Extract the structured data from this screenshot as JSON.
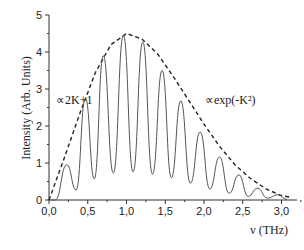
{
  "chart_data": {
    "type": "line",
    "title": "",
    "xlabel": "ν (THz)",
    "ylabel": "Intensity (Arb. Units)",
    "xlim": [
      0,
      3.2
    ],
    "ylim": [
      0,
      5
    ],
    "xticks": [
      "0,0",
      "0,5",
      "1,0",
      "1,5",
      "2,0",
      "2,5",
      "3,0"
    ],
    "xtick_values": [
      0,
      0.5,
      1.0,
      1.5,
      2.0,
      2.5,
      3.0
    ],
    "yticks": [
      "0",
      "1",
      "2",
      "3",
      "4",
      "5"
    ],
    "ytick_values": [
      0,
      1,
      2,
      3,
      4,
      5
    ],
    "grid": false,
    "legend": null,
    "series": [
      {
        "name": "Intensity spectrum",
        "style": "solid",
        "peaks_x": [
          0.23,
          0.47,
          0.7,
          0.96,
          1.21,
          1.46,
          1.7,
          1.95,
          2.2,
          2.45,
          2.69,
          2.95
        ],
        "peaks_y": [
          0.95,
          2.75,
          3.9,
          4.45,
          4.27,
          3.5,
          2.68,
          1.84,
          1.16,
          0.68,
          0.32,
          0.14
        ],
        "minima_y": [
          0.27,
          0.57,
          0.73,
          0.76,
          0.7,
          0.6,
          0.45,
          0.3,
          0.18,
          0.1,
          0.05,
          0.02
        ]
      },
      {
        "name": "Envelope ∝2K+1 (linear rise) then ∝exp(-K²)",
        "style": "dashed",
        "x": [
          0.0,
          0.2,
          0.4,
          0.6,
          0.8,
          1.0,
          1.2,
          1.4,
          1.6,
          1.8,
          2.0,
          2.2,
          2.4,
          2.6,
          2.8,
          3.0,
          3.1
        ],
        "y": [
          0.0,
          1.15,
          2.35,
          3.45,
          4.2,
          4.5,
          4.35,
          3.95,
          3.35,
          2.7,
          2.05,
          1.45,
          0.95,
          0.58,
          0.3,
          0.12,
          0.08
        ]
      }
    ],
    "annotations": [
      {
        "text": "∝2K+1",
        "x": 0.1,
        "y": 2.95
      },
      {
        "text": "∝exp(-K²)",
        "x": 2.02,
        "y": 2.95
      }
    ]
  }
}
